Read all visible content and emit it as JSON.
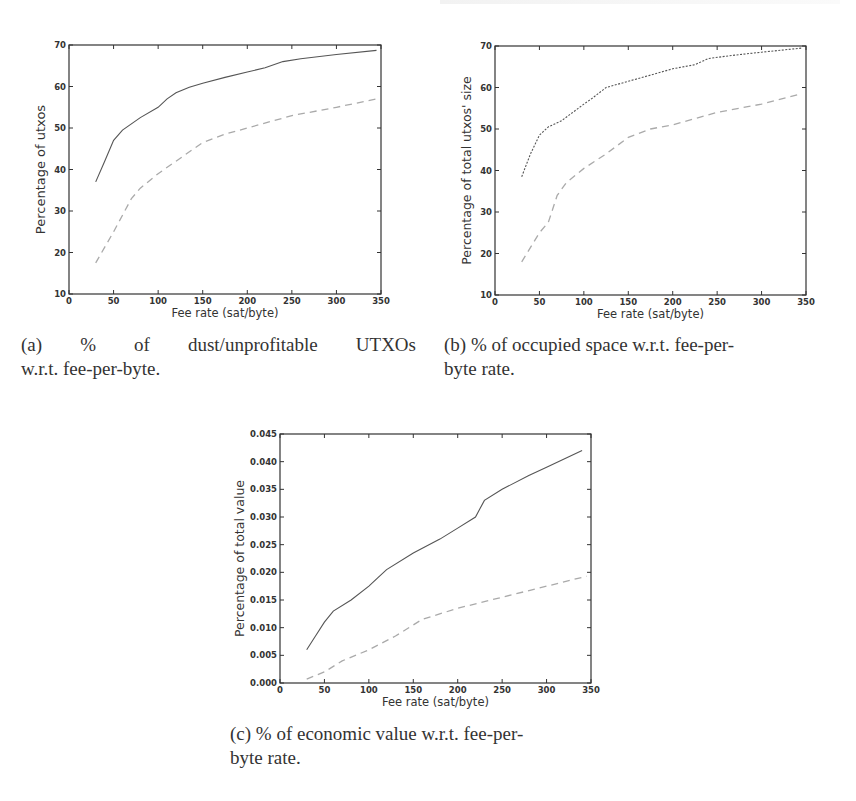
{
  "figure": {
    "subfigures": [
      {
        "id": "a",
        "caption_lines": [
          "(a)  %  of  dust/unprofitable  UTXOs",
          "w.r.t. fee-per-byte."
        ]
      },
      {
        "id": "b",
        "caption_lines": [
          "(b) % of occupied space w.r.t. fee-per-",
          "byte rate."
        ]
      },
      {
        "id": "c",
        "caption_lines": [
          "(c) % of economic value w.r.t. fee-per-",
          "byte rate."
        ]
      }
    ]
  },
  "chart_data": [
    {
      "id": "a",
      "type": "line",
      "title": "",
      "xlabel": "Fee rate (sat/byte)",
      "ylabel": "Percentage of utxos",
      "xlim": [
        0,
        350
      ],
      "ylim": [
        10,
        70
      ],
      "xticks": [
        0,
        50,
        100,
        150,
        200,
        250,
        300,
        350
      ],
      "yticks": [
        10,
        20,
        30,
        40,
        50,
        60,
        70
      ],
      "ytick_labels": [
        "10",
        "20",
        "30",
        "40",
        "50",
        "60",
        "70"
      ],
      "grid": false,
      "legend": null,
      "series": [
        {
          "name": "upper (solid)",
          "style": "solid",
          "color": "#555555",
          "x": [
            30,
            40,
            50,
            60,
            80,
            100,
            110,
            120,
            135,
            150,
            175,
            200,
            220,
            240,
            260,
            300,
            345
          ],
          "y": [
            37,
            42,
            47,
            49.5,
            52.5,
            55,
            57,
            58.5,
            59.8,
            60.8,
            62.2,
            63.5,
            64.5,
            66,
            66.7,
            67.7,
            68.7
          ]
        },
        {
          "name": "lower (dashed)",
          "style": "dashed",
          "color": "#aaaaaa",
          "x": [
            30,
            50,
            70,
            80,
            100,
            120,
            150,
            175,
            200,
            250,
            300,
            345
          ],
          "y": [
            17.5,
            25,
            33,
            35.5,
            39,
            42,
            46.5,
            48.5,
            50,
            53,
            55,
            57
          ]
        }
      ]
    },
    {
      "id": "b",
      "type": "line",
      "title": "",
      "xlabel": "Fee rate (sat/byte)",
      "ylabel": "Percentage of total utxos' size",
      "xlim": [
        0,
        350
      ],
      "ylim": [
        10,
        70
      ],
      "xticks": [
        0,
        50,
        100,
        150,
        200,
        250,
        300,
        350
      ],
      "yticks": [
        10,
        20,
        30,
        40,
        50,
        60,
        70
      ],
      "ytick_labels": [
        "10",
        "20",
        "30",
        "40",
        "50",
        "60",
        "70"
      ],
      "grid": false,
      "legend": null,
      "series": [
        {
          "name": "upper (dotted)",
          "style": "dotted",
          "color": "#555555",
          "x": [
            30,
            40,
            50,
            60,
            75,
            100,
            110,
            125,
            150,
            175,
            200,
            225,
            240,
            270,
            300,
            345
          ],
          "y": [
            38.5,
            44,
            48.5,
            50.5,
            52,
            56,
            57.5,
            60,
            61.5,
            63,
            64.5,
            65.5,
            67,
            67.8,
            68.5,
            69.5
          ]
        },
        {
          "name": "lower (dashed)",
          "style": "dashed",
          "color": "#aaaaaa",
          "x": [
            30,
            50,
            60,
            70,
            80,
            100,
            125,
            150,
            175,
            200,
            250,
            300,
            345
          ],
          "y": [
            18,
            25,
            27.5,
            34,
            37,
            40.5,
            44,
            48,
            50,
            51,
            54,
            56,
            58.5
          ]
        }
      ]
    },
    {
      "id": "c",
      "type": "line",
      "title": "",
      "xlabel": "Fee rate (sat/byte)",
      "ylabel": "Percentage of total value",
      "xlim": [
        0,
        350
      ],
      "ylim": [
        0,
        0.045
      ],
      "xticks": [
        0,
        50,
        100,
        150,
        200,
        250,
        300,
        350
      ],
      "yticks": [
        0,
        0.005,
        0.01,
        0.015,
        0.02,
        0.025,
        0.03,
        0.035,
        0.04,
        0.045
      ],
      "ytick_labels": [
        "0.000",
        "0.005",
        "0.010",
        "0.015",
        "0.020",
        "0.025",
        "0.030",
        "0.035",
        "0.040",
        "0.045"
      ],
      "grid": false,
      "legend": null,
      "series": [
        {
          "name": "upper (solid)",
          "style": "solid",
          "color": "#555555",
          "x": [
            30,
            40,
            50,
            60,
            80,
            100,
            110,
            120,
            150,
            180,
            200,
            220,
            225,
            230,
            250,
            280,
            300,
            340
          ],
          "y": [
            0.006,
            0.0085,
            0.011,
            0.013,
            0.015,
            0.0175,
            0.019,
            0.0205,
            0.0235,
            0.026,
            0.028,
            0.03,
            0.0315,
            0.033,
            0.035,
            0.0375,
            0.039,
            0.042
          ]
        },
        {
          "name": "lower (dashed)",
          "style": "dashed",
          "color": "#aaaaaa",
          "x": [
            30,
            50,
            70,
            100,
            130,
            160,
            200,
            250,
            300,
            345
          ],
          "y": [
            0.0007,
            0.002,
            0.004,
            0.006,
            0.0085,
            0.0115,
            0.0135,
            0.0155,
            0.0175,
            0.0193
          ]
        }
      ]
    }
  ]
}
